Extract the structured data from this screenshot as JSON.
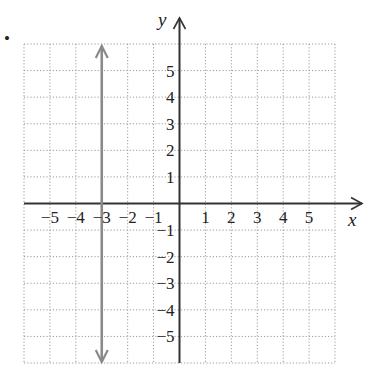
{
  "bullet": "•",
  "chart_data": {
    "type": "line",
    "title": "",
    "xlabel": "x",
    "ylabel": "y",
    "xlim": [
      -6,
      6
    ],
    "ylim": [
      -6,
      6
    ],
    "grid": true,
    "grid_style": "dotted",
    "x_ticks": [
      -5,
      -4,
      -3,
      -2,
      -1,
      1,
      2,
      3,
      4,
      5
    ],
    "y_ticks": [
      5,
      4,
      3,
      2,
      1,
      -1,
      -2,
      -3,
      -4,
      -5
    ],
    "x_tick_labels": [
      "−5",
      "−4",
      "−3",
      "−2",
      "−1",
      "1",
      "2",
      "3",
      "4",
      "5"
    ],
    "y_tick_labels": [
      "5",
      "4",
      "3",
      "2",
      "1",
      "−1",
      "−2",
      "−3",
      "−4",
      "−5"
    ],
    "series": [
      {
        "name": "x = -3",
        "description": "vertical line with arrows at both ends",
        "x": [
          -3,
          -3
        ],
        "y": [
          -6,
          6
        ],
        "color": "#8a8a8a"
      }
    ],
    "colors": {
      "axis": "#333333",
      "grid": "#9a9a9a",
      "line": "#8a8a8a"
    }
  }
}
